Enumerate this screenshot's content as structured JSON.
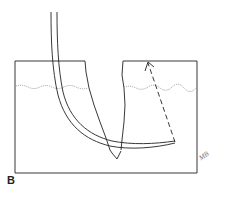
{
  "figure": {
    "panel_label": "B",
    "signature": "MB",
    "colors": {
      "line": "#222222",
      "dotted": "#888888"
    },
    "elements": {
      "tissue_block": "rectangle with V-shaped wedge incision",
      "dermal_layer_line": "wavy dotted line",
      "needle": "curved double-line needle",
      "arrow": "dashed arrow indicating needle path"
    }
  }
}
